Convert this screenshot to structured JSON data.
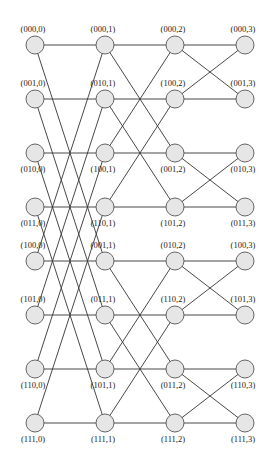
{
  "diagram": {
    "type": "butterfly-network",
    "stages": 4,
    "rows": 8,
    "colors": {
      "node_fill": "#e6e6e6",
      "node_stroke": "#555555",
      "edge": "#333333",
      "label": "#222222"
    },
    "layout": {
      "col_x": [
        35,
        105,
        175,
        245
      ],
      "row_y": [
        45,
        99,
        153,
        207,
        261,
        315,
        369,
        423
      ],
      "node_radius": 9
    },
    "columns": [
      {
        "stage": 0,
        "labels": [
          "(000,0)",
          "(001,0)",
          "(010,0)",
          "(011,0)",
          "(100,0)",
          "(101,0)",
          "(110,0)",
          "(111,0)"
        ]
      },
      {
        "stage": 1,
        "labels": [
          "(000,1)",
          "(010,1)",
          "(100,1)",
          "(110,1)",
          "(001,1)",
          "(011,1)",
          "(101,1)",
          "(111,1)"
        ]
      },
      {
        "stage": 2,
        "labels": [
          "(000,2)",
          "(100,2)",
          "(001,2)",
          "(101,2)",
          "(010,2)",
          "(110,2)",
          "(011,2)",
          "(111,2)"
        ]
      },
      {
        "stage": 3,
        "labels": [
          "(000,3)",
          "(001,3)",
          "(010,3)",
          "(011,3)",
          "(100,3)",
          "(101,3)",
          "(110,3)",
          "(111,3)"
        ]
      }
    ],
    "label_position_by_row": [
      "above",
      "above",
      "below",
      "below",
      "above",
      "above",
      "below",
      "below"
    ],
    "edges": [
      {
        "from_col": 0,
        "to_col": 1,
        "pairs": [
          [
            0,
            0
          ],
          [
            0,
            4
          ],
          [
            1,
            1
          ],
          [
            1,
            5
          ],
          [
            2,
            2
          ],
          [
            2,
            6
          ],
          [
            3,
            3
          ],
          [
            3,
            7
          ],
          [
            4,
            4
          ],
          [
            4,
            0
          ],
          [
            5,
            5
          ],
          [
            5,
            1
          ],
          [
            6,
            6
          ],
          [
            6,
            2
          ],
          [
            7,
            7
          ],
          [
            7,
            3
          ]
        ]
      },
      {
        "from_col": 1,
        "to_col": 2,
        "pairs": [
          [
            0,
            0
          ],
          [
            0,
            2
          ],
          [
            1,
            1
          ],
          [
            1,
            3
          ],
          [
            2,
            2
          ],
          [
            2,
            0
          ],
          [
            3,
            3
          ],
          [
            3,
            1
          ],
          [
            4,
            4
          ],
          [
            4,
            6
          ],
          [
            5,
            5
          ],
          [
            5,
            7
          ],
          [
            6,
            6
          ],
          [
            6,
            4
          ],
          [
            7,
            7
          ],
          [
            7,
            5
          ]
        ]
      },
      {
        "from_col": 2,
        "to_col": 3,
        "pairs": [
          [
            0,
            0
          ],
          [
            0,
            1
          ],
          [
            1,
            1
          ],
          [
            1,
            0
          ],
          [
            2,
            2
          ],
          [
            2,
            3
          ],
          [
            3,
            3
          ],
          [
            3,
            2
          ],
          [
            4,
            4
          ],
          [
            4,
            5
          ],
          [
            5,
            5
          ],
          [
            5,
            4
          ],
          [
            6,
            6
          ],
          [
            6,
            7
          ],
          [
            7,
            7
          ],
          [
            7,
            6
          ]
        ]
      }
    ]
  }
}
